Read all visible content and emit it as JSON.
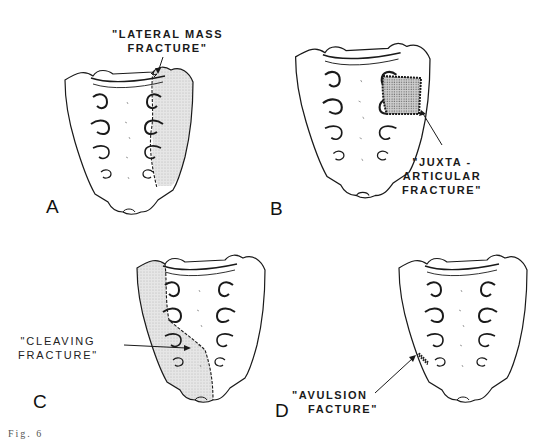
{
  "figure": {
    "panels": [
      {
        "id": "A",
        "letter": "A",
        "label_line1": "\"LATERAL MASS",
        "label_line2": "FRACTURE\""
      },
      {
        "id": "B",
        "letter": "B",
        "label_line1": "\"JUXTA -",
        "label_line2": "ARTICULAR",
        "label_line3": "FRACTURE\""
      },
      {
        "id": "C",
        "letter": "C",
        "label_line1": "\"CLEAVING",
        "label_line2": "FRACTURE\""
      },
      {
        "id": "D",
        "letter": "D",
        "label_line1": "\"AVULSION",
        "label_line2": "FACTURE\""
      }
    ],
    "caption": "Fig. 6"
  },
  "colors": {
    "ink": "#1a1a1a",
    "shade": "#d9d9d9",
    "background": "#ffffff"
  }
}
